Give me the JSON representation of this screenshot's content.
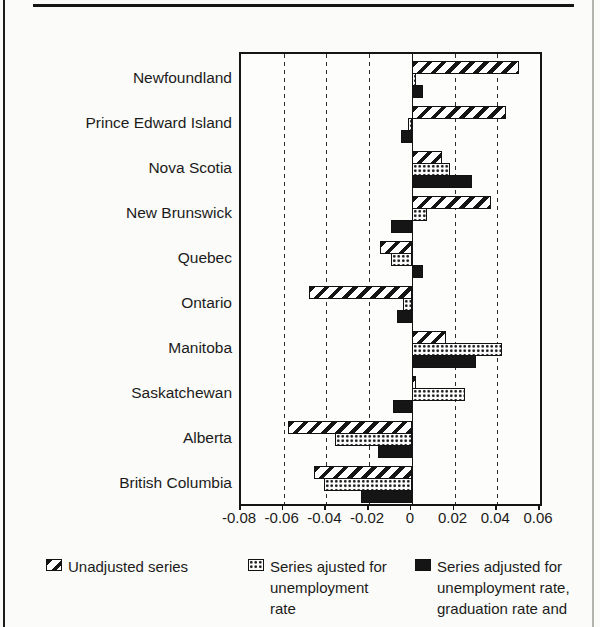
{
  "page": {
    "background": "#fbfbf9",
    "ink_color": "#151515"
  },
  "chart_data": {
    "type": "bar",
    "orientation": "horizontal",
    "title": "",
    "xlabel": "",
    "ylabel": "",
    "categories": [
      "Newfoundland",
      "Prince Edward Island",
      "Nova Scotia",
      "New Brunswick",
      "Quebec",
      "Ontario",
      "Manitoba",
      "Saskatchewan",
      "Alberta",
      "British Columbia"
    ],
    "series": [
      {
        "name": "Unadjusted series",
        "pattern": "diagonal-hatch",
        "values": [
          0.05,
          0.044,
          0.014,
          0.037,
          -0.015,
          -0.048,
          0.016,
          0.002,
          -0.058,
          -0.046
        ]
      },
      {
        "name": "Series ajusted for unemployment rate",
        "pattern": "dots",
        "values": [
          0.002,
          -0.002,
          0.018,
          0.007,
          -0.01,
          -0.004,
          0.042,
          0.025,
          -0.036,
          -0.041
        ]
      },
      {
        "name": "Series adjusted for unemployment rate, graduation rate and",
        "pattern": "solid-black",
        "values": [
          0.005,
          -0.005,
          0.028,
          -0.01,
          0.005,
          -0.007,
          0.03,
          -0.009,
          -0.016,
          -0.024
        ]
      }
    ],
    "xlim": [
      -0.08,
      0.06
    ],
    "xtick_values": [
      -0.08,
      -0.06,
      -0.04,
      -0.02,
      0,
      0.02,
      0.04,
      0.06
    ],
    "xtick_labels": [
      "-0.08",
      "-0.06",
      "-0.04",
      "-0.02",
      "0",
      "0.02",
      "0.04",
      "0.06"
    ],
    "grid": "dashed-vertical",
    "zero_line": true,
    "legend_position": "bottom"
  },
  "legend": {
    "items": [
      {
        "label": "Unadjusted series",
        "pattern": "diagonal-hatch"
      },
      {
        "label": "Series ajusted for unemployment rate",
        "pattern": "dots"
      },
      {
        "label": "Series adjusted for unemployment rate, graduation rate and",
        "pattern": "solid-black"
      }
    ]
  }
}
